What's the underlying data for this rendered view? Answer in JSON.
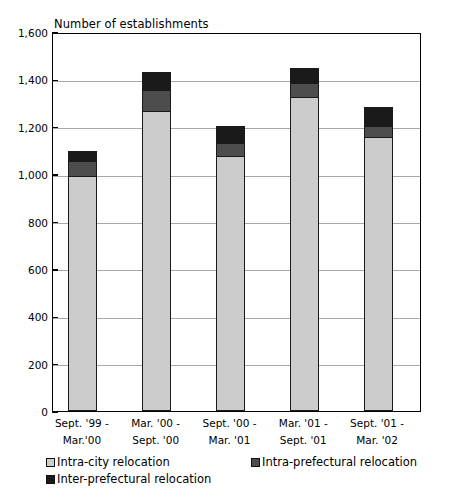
{
  "chart_data": {
    "type": "bar",
    "subtype": "stacked-vertical",
    "title": "Number of establishments",
    "xlabel": "",
    "ylabel": "",
    "ylim": [
      0,
      1600
    ],
    "ytick_step": 200,
    "grid": true,
    "legend_position": "bottom",
    "categories": [
      "Sept. '99 - Mar.'00",
      "Mar. '00 - Sept. '00",
      "Sept. '00 - Mar. '01",
      "Mar. '01 - Sept. '01",
      "Sept. '01 - Mar. '02"
    ],
    "category_lines": [
      [
        "Sept. '99 -",
        "Mar.'00"
      ],
      [
        "Mar. '00 -",
        "Sept. '00"
      ],
      [
        "Sept. '00 -",
        "Mar. '01"
      ],
      [
        "Mar. '01 -",
        "Sept. '01"
      ],
      [
        "Sept. '01 -",
        "Mar. '02"
      ]
    ],
    "ytick_labels": [
      "0",
      "200",
      "400",
      "600",
      "800",
      "1,000",
      "1,200",
      "1,400",
      "1,600"
    ],
    "ytick_values": [
      0,
      200,
      400,
      600,
      800,
      1000,
      1200,
      1400,
      1600
    ],
    "series": [
      {
        "name": "Intra-city relocation",
        "color": "#cccccc",
        "values": [
          988,
          1262,
          1072,
          1321,
          1152
        ]
      },
      {
        "name": "Intra-prefectural relocation",
        "color": "#4d4d4d",
        "values": [
          63,
          88,
          55,
          59,
          47
        ]
      },
      {
        "name": "Inter-prefectural relocation",
        "color": "#1a1a1a",
        "values": [
          42,
          76,
          72,
          63,
          80
        ]
      }
    ],
    "totals": [
      1093,
      1426,
      1199,
      1443,
      1279
    ]
  },
  "legend": {
    "items": [
      {
        "label": "Intra-city relocation",
        "color": "#cccccc"
      },
      {
        "label": "Intra-prefectural relocation",
        "color": "#4d4d4d"
      },
      {
        "label": "Inter-prefectural relocation",
        "color": "#1a1a1a"
      }
    ]
  },
  "colors": {
    "axis": "#000000",
    "grid": "#a8a8a8",
    "background": "#ffffff",
    "series_light": "#cccccc",
    "series_mid": "#4d4d4d",
    "series_dark": "#1a1a1a"
  }
}
